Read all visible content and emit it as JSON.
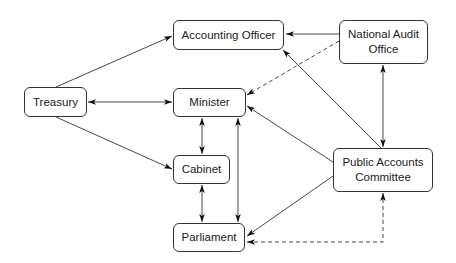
{
  "diagram": {
    "nodes": [
      {
        "id": "accounting_officer",
        "label": "Accounting Officer",
        "x": 173,
        "y": 20,
        "w": 111,
        "h": 30
      },
      {
        "id": "national_audit_office",
        "label": "National Audit Office",
        "x": 339,
        "y": 20,
        "w": 89,
        "h": 44
      },
      {
        "id": "treasury",
        "label": "Treasury",
        "x": 24,
        "y": 87,
        "w": 63,
        "h": 30
      },
      {
        "id": "minister",
        "label": "Minister",
        "x": 173,
        "y": 88,
        "w": 73,
        "h": 29
      },
      {
        "id": "cabinet",
        "label": "Cabinet",
        "x": 173,
        "y": 155,
        "w": 57,
        "h": 29
      },
      {
        "id": "parliament",
        "label": "Parliament",
        "x": 173,
        "y": 223,
        "w": 72,
        "h": 29
      },
      {
        "id": "public_accounts_committee",
        "label": "Public Accounts Committee",
        "x": 333,
        "y": 148,
        "w": 100,
        "h": 44
      }
    ],
    "edges": [
      {
        "from": "treasury",
        "to": "accounting_officer",
        "style": "solid",
        "direction": "forward"
      },
      {
        "from": "treasury",
        "to": "minister",
        "style": "solid",
        "direction": "both"
      },
      {
        "from": "treasury",
        "to": "cabinet",
        "style": "solid",
        "direction": "forward"
      },
      {
        "from": "national_audit_office",
        "to": "accounting_officer",
        "style": "solid",
        "direction": "forward"
      },
      {
        "from": "national_audit_office",
        "to": "minister",
        "style": "dashed",
        "direction": "forward"
      },
      {
        "from": "national_audit_office",
        "to": "public_accounts_committee",
        "style": "solid",
        "direction": "both"
      },
      {
        "from": "public_accounts_committee",
        "to": "accounting_officer",
        "style": "solid",
        "direction": "forward"
      },
      {
        "from": "public_accounts_committee",
        "to": "minister",
        "style": "solid",
        "direction": "forward"
      },
      {
        "from": "public_accounts_committee",
        "to": "parliament",
        "style": "solid",
        "direction": "forward"
      },
      {
        "from": "parliament",
        "to": "public_accounts_committee",
        "style": "dashed",
        "direction": "both"
      },
      {
        "from": "minister",
        "to": "cabinet",
        "style": "solid",
        "direction": "both"
      },
      {
        "from": "minister",
        "to": "parliament",
        "style": "solid",
        "direction": "both"
      },
      {
        "from": "cabinet",
        "to": "parliament",
        "style": "solid",
        "direction": "both"
      }
    ]
  },
  "labels": {
    "accounting_officer": "Accounting Officer",
    "nao_line1": "National Audit",
    "nao_line2": "Office",
    "treasury": "Treasury",
    "minister": "Minister",
    "cabinet": "Cabinet",
    "parliament": "Parliament",
    "pac_line1": "Public Accounts",
    "pac_line2": "Committee"
  }
}
